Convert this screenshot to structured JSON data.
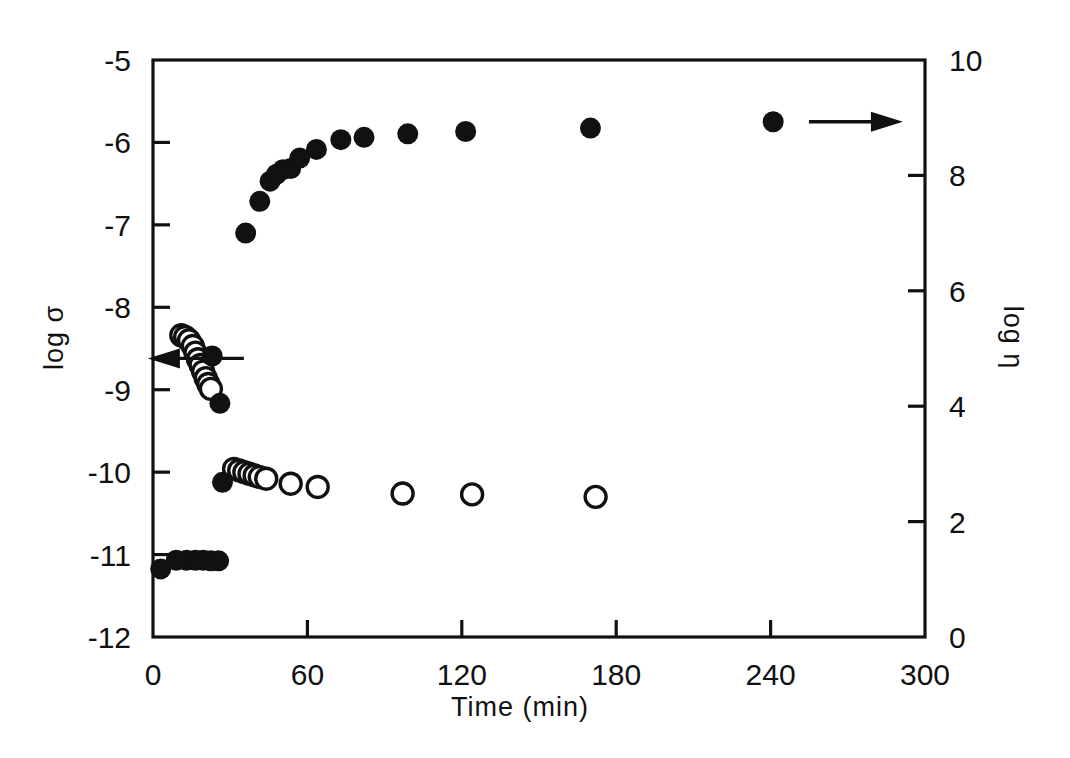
{
  "chart_data": {
    "type": "scatter",
    "title": "",
    "xlabel": "Time (min)",
    "ylabel_left": "log σ",
    "ylabel_right": "log η",
    "xlim": [
      0,
      300
    ],
    "xticks": [
      0,
      60,
      120,
      180,
      240,
      300
    ],
    "xticklabels": [
      "0",
      "60",
      "120",
      "180",
      "240",
      "300"
    ],
    "ylim_left": [
      -12,
      -5
    ],
    "yticks_left": [
      -5,
      -6,
      -7,
      -8,
      -9,
      -10,
      -11,
      -12
    ],
    "yticklabels_left": [
      "-5",
      "-6",
      "-7",
      "-8",
      "-9",
      "-10",
      "-11",
      "-12"
    ],
    "ylim_right": [
      0,
      10
    ],
    "yticks_right": [
      0,
      2,
      4,
      6,
      8,
      10
    ],
    "yticklabels_right": [
      "0",
      "2",
      "4",
      "6",
      "8",
      "10"
    ],
    "grid": false,
    "legend": "none",
    "annotations": [
      {
        "name": "left-arrow",
        "text": "←",
        "x": 12,
        "y": -8.62,
        "axis": "left",
        "meaning": "open circles read on left axis"
      },
      {
        "name": "right-arrow",
        "text": "→",
        "x": 272,
        "y": 8.93,
        "axis": "right",
        "meaning": "filled circles read on right axis"
      }
    ],
    "series": [
      {
        "name": "log eta (filled circles, right axis)",
        "marker": "filled-circle",
        "axis": "right",
        "color": "#111111",
        "points": [
          [
            3.0,
            1.18
          ],
          [
            9.0,
            1.33
          ],
          [
            13.0,
            1.33
          ],
          [
            16.5,
            1.33
          ],
          [
            19.5,
            1.33
          ],
          [
            22.5,
            1.32
          ],
          [
            25.5,
            1.32
          ],
          [
            23.0,
            4.87
          ],
          [
            26.0,
            4.05
          ],
          [
            27.0,
            2.68
          ],
          [
            36.0,
            7.0
          ],
          [
            41.5,
            7.55
          ],
          [
            45.5,
            7.9
          ],
          [
            48.0,
            8.02
          ],
          [
            50.5,
            8.1
          ],
          [
            53.5,
            8.12
          ],
          [
            57.0,
            8.3
          ],
          [
            63.5,
            8.45
          ],
          [
            73.0,
            8.62
          ],
          [
            82.0,
            8.66
          ],
          [
            99.0,
            8.72
          ],
          [
            121.5,
            8.76
          ],
          [
            170.0,
            8.82
          ],
          [
            241.0,
            8.93
          ]
        ]
      },
      {
        "name": "log sigma (open circles, left axis)",
        "marker": "open-circle",
        "axis": "left",
        "color": "#111111",
        "points": [
          [
            11.0,
            -8.34
          ],
          [
            12.5,
            -8.36
          ],
          [
            14.0,
            -8.4
          ],
          [
            15.5,
            -8.47
          ],
          [
            16.5,
            -8.55
          ],
          [
            17.5,
            -8.63
          ],
          [
            18.5,
            -8.7
          ],
          [
            19.5,
            -8.78
          ],
          [
            20.5,
            -8.86
          ],
          [
            21.5,
            -8.93
          ],
          [
            22.5,
            -8.99
          ],
          [
            31.5,
            -9.96
          ],
          [
            33.5,
            -9.98
          ],
          [
            35.5,
            -10.0
          ],
          [
            37.5,
            -10.02
          ],
          [
            39.5,
            -10.04
          ],
          [
            41.5,
            -10.06
          ],
          [
            44.0,
            -10.08
          ],
          [
            53.5,
            -10.14
          ],
          [
            64.0,
            -10.18
          ],
          [
            97.0,
            -10.26
          ],
          [
            124.0,
            -10.27
          ],
          [
            172.0,
            -10.3
          ]
        ]
      }
    ]
  },
  "meta": {
    "figure_name": "log-sigma-log-eta-vs-time",
    "marker_open_label": "open-circle",
    "marker_filled_label": "filled-circle"
  }
}
